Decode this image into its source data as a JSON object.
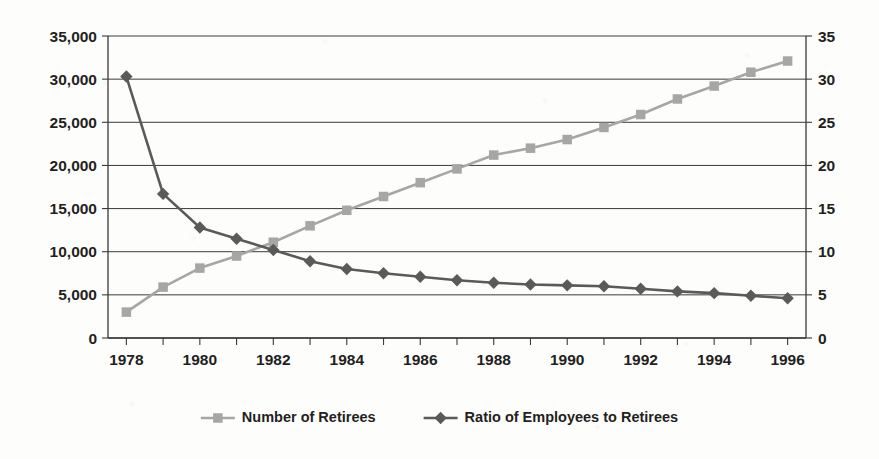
{
  "chart_data": {
    "type": "line",
    "title": "",
    "subtitle": "",
    "xlabel": "",
    "ylabel": "",
    "x": [
      1978,
      1979,
      1980,
      1981,
      1982,
      1983,
      1984,
      1985,
      1986,
      1987,
      1988,
      1989,
      1990,
      1991,
      1992,
      1993,
      1994,
      1995,
      1996
    ],
    "series": [
      {
        "name": "Number of Retirees",
        "axis": "left",
        "color": "#a6a6a6",
        "marker": "square",
        "values": [
          3000,
          5900,
          8100,
          9500,
          11100,
          13000,
          14800,
          16400,
          18000,
          19600,
          21200,
          22000,
          23000,
          24400,
          25900,
          27700,
          29200,
          30800,
          32100
        ]
      },
      {
        "name": "Ratio of Employees to Retirees",
        "axis": "right",
        "color": "#5a5a5a",
        "marker": "diamond",
        "values": [
          30.3,
          16.7,
          12.8,
          11.5,
          10.2,
          8.9,
          8.0,
          7.5,
          7.1,
          6.7,
          6.4,
          6.2,
          6.1,
          6.0,
          5.7,
          5.4,
          5.2,
          4.9,
          4.6
        ]
      }
    ],
    "x_tick_labels": [
      "1978",
      "1980",
      "1982",
      "1984",
      "1986",
      "1988",
      "1990",
      "1992",
      "1994",
      "1996"
    ],
    "x_tick_values": [
      1978,
      1980,
      1982,
      1984,
      1986,
      1988,
      1990,
      1992,
      1994,
      1996
    ],
    "x_minor_ticks_every": 1,
    "xlim": [
      1977.5,
      1996.5
    ],
    "y_left_ticks": [
      0,
      5000,
      10000,
      15000,
      20000,
      25000,
      30000,
      35000
    ],
    "y_left_tick_labels": [
      "0",
      "5,000",
      "10,000",
      "15,000",
      "20,000",
      "25,000",
      "30,000",
      "35,000"
    ],
    "ylim_left": [
      0,
      35000
    ],
    "y_right_ticks": [
      0,
      5,
      10,
      15,
      20,
      25,
      30,
      35
    ],
    "y_right_tick_labels": [
      "0",
      "5",
      "10",
      "15",
      "20",
      "25",
      "30",
      "35"
    ],
    "ylim_right": [
      0,
      35
    ],
    "grid": "horizontal",
    "legend_position": "bottom",
    "legend": [
      {
        "label": "Number of Retirees",
        "color": "#a6a6a6",
        "marker": "square"
      },
      {
        "label": "Ratio of Employees to Retirees",
        "color": "#5a5a5a",
        "marker": "diamond"
      }
    ]
  }
}
